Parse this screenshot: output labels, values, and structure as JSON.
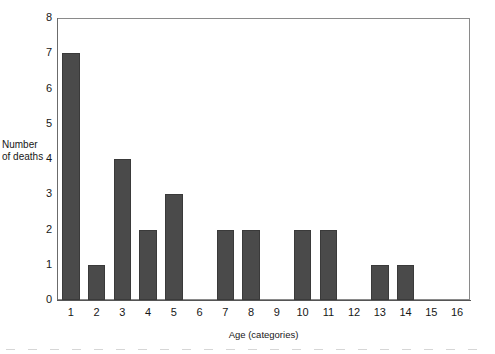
{
  "chart_data": {
    "type": "bar",
    "title": "",
    "subtitle": "",
    "xlabel": "Age (categories)",
    "ylabel": "Number of deaths",
    "ylabel_lines": [
      "Number",
      "of deaths"
    ],
    "categories": [
      "1",
      "2",
      "3",
      "4",
      "5",
      "6",
      "7",
      "8",
      "9",
      "10",
      "11",
      "12",
      "13",
      "14",
      "15",
      "16"
    ],
    "values": [
      7,
      1,
      4,
      2,
      3,
      0,
      2,
      2,
      0,
      2,
      2,
      0,
      1,
      1,
      0,
      0
    ],
    "series": [
      {
        "name": "Number of deaths",
        "values": [
          7,
          1,
          4,
          2,
          3,
          0,
          2,
          2,
          0,
          2,
          2,
          0,
          1,
          1,
          0,
          0
        ]
      }
    ],
    "ylim": [
      0,
      8
    ],
    "y_ticks": [
      "0",
      "1",
      "2",
      "3",
      "4",
      "5",
      "6",
      "7",
      "8"
    ],
    "y_tick_values": [
      0,
      1,
      2,
      3,
      4,
      5,
      6,
      7,
      8
    ],
    "grid": false,
    "legend": false,
    "legend_position": "none",
    "annotations": [],
    "bar_color": "#4a4a4a",
    "bar_border_color": "#3a3a3a",
    "plot_border_color": "#8a8a8a",
    "axis_color": "#555555",
    "background_color": "#ffffff"
  }
}
